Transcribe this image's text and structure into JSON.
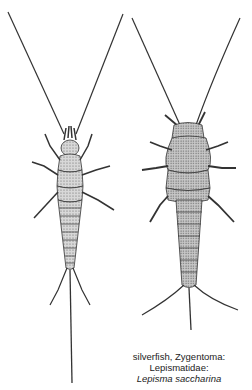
{
  "figure": {
    "subjects": [
      {
        "name": "left-specimen",
        "view": "dorsal, slender"
      },
      {
        "name": "right-specimen",
        "view": "dorsal, stout"
      }
    ],
    "caption": {
      "line1": "silverfish, Zygentoma:",
      "line2": "Lepismatidae:",
      "line3": "Lepisma saccharina"
    },
    "colors": {
      "ink": "#333333",
      "shade": "#9a9a9a",
      "background": "#ffffff"
    }
  }
}
